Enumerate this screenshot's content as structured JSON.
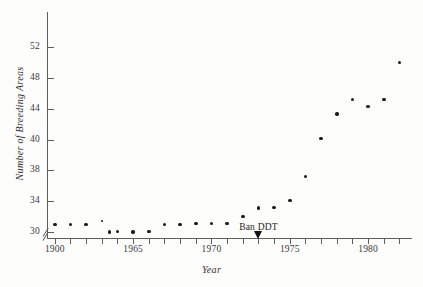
{
  "chart_data": {
    "type": "scatter",
    "title": "",
    "xlabel": "Year",
    "ylabel": "Number of Breeding Areas",
    "xlim": [
      1959.5,
      1982.8
    ],
    "ylim": [
      29.0,
      53.5
    ],
    "grid": false,
    "legend": null,
    "y_axis_break": true,
    "y_tick_labels": [
      "30",
      "34",
      "38",
      "40",
      "44",
      "48",
      "52"
    ],
    "y_tick_values": [
      30,
      34,
      38,
      40,
      44,
      48,
      52
    ],
    "x_tick_labels": [
      "1900",
      "1965",
      "1970",
      "1975",
      "1980"
    ],
    "x_tick_values": [
      1960,
      1965,
      1970,
      1975,
      1980
    ],
    "x_minor_ticks": [
      1961,
      1962,
      1963,
      1964,
      1966,
      1967,
      1968,
      1969,
      1971,
      1972,
      1973,
      1974,
      1976,
      1977,
      1978,
      1979,
      1981,
      1982
    ],
    "annotations": [
      {
        "text": "Ban DDT",
        "x": 1973,
        "y": 30.6,
        "arrow": "down"
      }
    ],
    "x": [
      1960,
      1961,
      1962,
      1963,
      1963.5,
      1964,
      1965,
      1966,
      1967,
      1968,
      1969,
      1970,
      1971,
      1972,
      1973,
      1974,
      1975,
      1976,
      1977,
      1978,
      1979,
      1980,
      1981,
      1982
    ],
    "y": [
      31.0,
      31.0,
      31.0,
      31.4,
      30.0,
      30.1,
      30.0,
      30.1,
      31.0,
      31.0,
      31.1,
      31.1,
      31.1,
      32.0,
      33.1,
      33.2,
      34.1,
      37.2,
      40.1,
      43.3,
      45.2,
      44.3,
      45.2,
      50.0
    ],
    "points": [
      {
        "x": 1960,
        "y": 31.0,
        "size": "normal"
      },
      {
        "x": 1961,
        "y": 31.0,
        "size": "normal"
      },
      {
        "x": 1962,
        "y": 31.0,
        "size": "normal"
      },
      {
        "x": 1963,
        "y": 31.4,
        "size": "small"
      },
      {
        "x": 1963.5,
        "y": 30.0,
        "size": "normal"
      },
      {
        "x": 1964,
        "y": 30.1,
        "size": "normal"
      },
      {
        "x": 1965,
        "y": 30.0,
        "size": "normal"
      },
      {
        "x": 1966,
        "y": 30.1,
        "size": "normal"
      },
      {
        "x": 1967,
        "y": 31.0,
        "size": "normal"
      },
      {
        "x": 1968,
        "y": 31.0,
        "size": "normal"
      },
      {
        "x": 1969,
        "y": 31.1,
        "size": "normal"
      },
      {
        "x": 1970,
        "y": 31.1,
        "size": "normal"
      },
      {
        "x": 1971,
        "y": 31.1,
        "size": "normal"
      },
      {
        "x": 1972,
        "y": 32.0,
        "size": "normal"
      },
      {
        "x": 1973,
        "y": 33.1,
        "size": "normal"
      },
      {
        "x": 1974,
        "y": 33.2,
        "size": "normal"
      },
      {
        "x": 1975,
        "y": 34.1,
        "size": "normal"
      },
      {
        "x": 1976,
        "y": 37.2,
        "size": "normal"
      },
      {
        "x": 1977,
        "y": 40.1,
        "size": "normal"
      },
      {
        "x": 1978,
        "y": 43.3,
        "size": "normal"
      },
      {
        "x": 1979,
        "y": 45.2,
        "size": "normal"
      },
      {
        "x": 1980,
        "y": 44.3,
        "size": "normal"
      },
      {
        "x": 1981,
        "y": 45.2,
        "size": "normal"
      },
      {
        "x": 1982,
        "y": 50.0,
        "size": "normal"
      }
    ],
    "colors": {
      "point": "#1a1a1a",
      "axis": "#5d5d5d",
      "text": "#333333",
      "background": "#fdfdfc"
    }
  }
}
